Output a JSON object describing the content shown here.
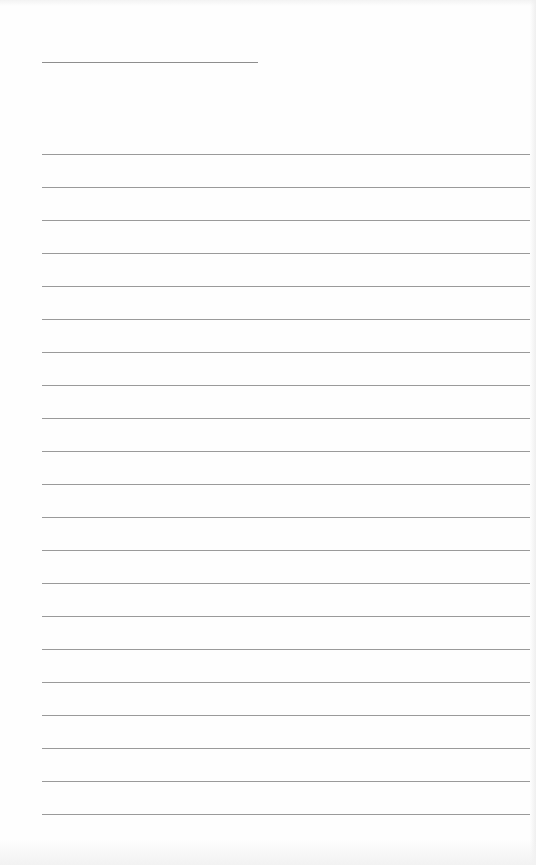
{
  "page": {
    "type": "lined-paper",
    "background_color": "#fefefe",
    "line_color": "#9a9a9a",
    "title_line": {
      "x": 42,
      "y": 62,
      "width": 216,
      "color": "#8e8e8e"
    },
    "ruled_lines": {
      "count": 21,
      "start_x": 42,
      "start_y": 154,
      "width": 488,
      "spacing": 33
    }
  }
}
